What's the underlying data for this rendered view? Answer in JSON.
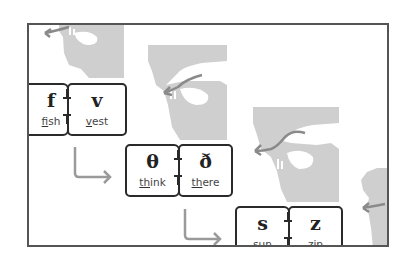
{
  "diagram": {
    "type": "phonetic-articulation-sequence",
    "colors": {
      "frame": "#555555",
      "box_border": "#2a2a2a",
      "head_silhouette": "#cfcfcf",
      "airflow_arrow": "#8a8a8a",
      "connector_arrow": "#9a9a9a"
    },
    "pairs": [
      {
        "voiceless": {
          "symbol": "f",
          "example_underlined": "f",
          "example_rest": "ish"
        },
        "voiced": {
          "symbol": "v",
          "example_underlined": "v",
          "example_rest": "est"
        }
      },
      {
        "voiceless": {
          "symbol": "θ",
          "example_underlined": "th",
          "example_rest": "ink"
        },
        "voiced": {
          "symbol": "ð",
          "example_underlined": "th",
          "example_rest": "ere"
        }
      },
      {
        "voiceless": {
          "symbol": "s",
          "example_underlined": "s",
          "example_rest": "un"
        },
        "voiced": {
          "symbol": "z",
          "example_underlined": "z",
          "example_rest": "ip"
        }
      }
    ],
    "heads": [
      {
        "name": "labiodental-head",
        "icon": "head-profile-icon"
      },
      {
        "name": "dental-head",
        "icon": "head-profile-icon"
      },
      {
        "name": "alveolar-head",
        "icon": "head-profile-icon"
      },
      {
        "name": "next-head-partial",
        "icon": "head-profile-icon"
      }
    ],
    "connectors": [
      {
        "from": "f-v",
        "to": "th-dh",
        "icon": "elbow-arrow-icon"
      },
      {
        "from": "th-dh",
        "to": "s-z",
        "icon": "elbow-arrow-icon"
      }
    ]
  }
}
